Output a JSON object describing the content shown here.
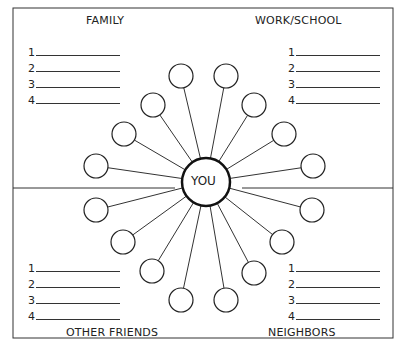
{
  "center": {
    "label": "YOU",
    "x": 206,
    "y": 182,
    "r": 24
  },
  "quadrants": [
    {
      "name": "family",
      "title": "FAMILY",
      "title_x": 86,
      "title_y": 14,
      "list_x": 28,
      "list_y": 46,
      "items": [
        "1",
        "2",
        "3",
        "4"
      ]
    },
    {
      "name": "work-school",
      "title": "WORK/SCHOOL",
      "title_x": 255,
      "title_y": 14,
      "list_x": 288,
      "list_y": 46,
      "items": [
        "1",
        "2",
        "3",
        "4"
      ]
    },
    {
      "name": "other-friends",
      "title": "OTHER FRIENDS",
      "title_x": 66,
      "title_y": 326,
      "list_x": 28,
      "list_y": 262,
      "items": [
        "1",
        "2",
        "3",
        "4"
      ]
    },
    {
      "name": "neighbors",
      "title": "NEIGHBORS",
      "title_x": 268,
      "title_y": 326,
      "list_x": 288,
      "list_y": 262,
      "items": [
        "1",
        "2",
        "3",
        "4"
      ]
    }
  ],
  "nodes": [
    {
      "x": 181,
      "y": 76
    },
    {
      "x": 153,
      "y": 105
    },
    {
      "x": 124,
      "y": 134
    },
    {
      "x": 96,
      "y": 166
    },
    {
      "x": 226,
      "y": 76
    },
    {
      "x": 254,
      "y": 105
    },
    {
      "x": 284,
      "y": 134
    },
    {
      "x": 313,
      "y": 166
    },
    {
      "x": 96,
      "y": 210
    },
    {
      "x": 123,
      "y": 242
    },
    {
      "x": 152,
      "y": 271
    },
    {
      "x": 181,
      "y": 300
    },
    {
      "x": 312,
      "y": 210
    },
    {
      "x": 282,
      "y": 242
    },
    {
      "x": 254,
      "y": 273
    },
    {
      "x": 226,
      "y": 300
    }
  ]
}
